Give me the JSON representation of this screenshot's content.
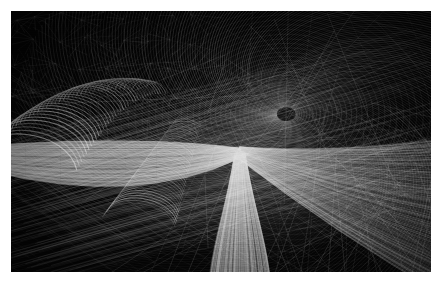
{
  "artwork": {
    "title": "Abstract Generative Line Art",
    "medium": "algorithmic wireframe rendering",
    "orientation": "landscape",
    "canvas": {
      "page_width": 442,
      "page_height": 284,
      "art_x": 11,
      "art_y": 11,
      "art_width": 420,
      "art_height": 261
    },
    "palette": {
      "page_background": "#ffffff",
      "art_background": "#050505",
      "line_bright": "#ffffff",
      "line_mid": "#b4b4b4",
      "line_dim": "#5a5a5a",
      "line_faint": "#2a2a2a",
      "highlight": "#f6f6f6"
    },
    "description": "Dense monochrome wireframe mesh forming a swirling vortex funnel at center-right, with crescent hook spines at upper left, a bright diagonal ridge sweeping across the lower half, and sparse crossing straight lines over near-black in the upper right corner.",
    "regions": [
      {
        "name": "top-left-starburst-field",
        "tone": "very-dark",
        "motif": "repeating fan / starburst spikes"
      },
      {
        "name": "upper-left-crescent-spines",
        "tone": "mid",
        "motif": "stacked curved hook ribs"
      },
      {
        "name": "central-vortex-funnel",
        "tone": "bright",
        "motif": "radial converging curved mesh"
      },
      {
        "name": "lower-bright-ridge",
        "tone": "bright",
        "motif": "vertical luminous band over grid"
      },
      {
        "name": "lower-left-hatch-plane",
        "tone": "mid-dark",
        "motif": "diagonal moire hatching"
      },
      {
        "name": "upper-right-sparse-lattice",
        "tone": "near-black",
        "motif": "long crossing straight chords"
      }
    ]
  },
  "generator": {
    "seed": 20240517,
    "layers": [
      {
        "id": "sparse-lattice",
        "name": "upper-right-sparse-lattice",
        "kind": "chords",
        "count": 150,
        "x_min": 0.46,
        "x_max": 1.02,
        "y_min": -0.04,
        "y_max": 0.82,
        "stroke": "#9a9a9a",
        "width": 0.45,
        "opacity": 0.52
      },
      {
        "id": "starburst-field",
        "name": "top-left-starburst-field",
        "kind": "starbursts",
        "cols": 9,
        "rows": 5,
        "x_min": -0.02,
        "x_max": 0.46,
        "y_min": -0.03,
        "y_max": 0.46,
        "rays": 9,
        "radius": 0.055,
        "stroke": "#7e7e7e",
        "width": 0.4,
        "opacity": 0.55
      },
      {
        "id": "vortex-fan",
        "name": "central-vortex-funnel",
        "kind": "vortex",
        "cx": 0.655,
        "cy": 0.395,
        "spokes": 210,
        "rings": 46,
        "r_min": 0.025,
        "r_max": 0.7,
        "twist": 2.45,
        "stroke": "#e8e8e8",
        "width": 0.38,
        "opacity": 0.62
      },
      {
        "id": "crescent-spines",
        "name": "upper-left-crescent-spines",
        "kind": "hooks",
        "count": 38,
        "origin_x": 0.3,
        "origin_y": 0.3,
        "spread": 0.34,
        "stroke": "#d6d6d6",
        "width": 0.55,
        "opacity": 0.68
      },
      {
        "id": "hatch-plane",
        "name": "lower-left-hatch-plane",
        "kind": "hatch",
        "count": 240,
        "y_min": 0.5,
        "y_max": 1.03,
        "angle_deg": 27,
        "stroke": "#b0b0b0",
        "width": 0.42,
        "opacity": 0.5
      },
      {
        "id": "bright-ridge",
        "name": "lower-bright-ridge",
        "kind": "ridge",
        "apex_x": 0.545,
        "apex_y": 0.545,
        "count": 120,
        "stroke": "#ffffff",
        "width": 0.6,
        "opacity": 0.8
      }
    ]
  }
}
